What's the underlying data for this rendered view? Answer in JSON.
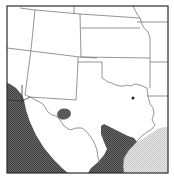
{
  "map": {
    "region": "South-central United States",
    "colors": {
      "background": "#ffffff",
      "border": "#2a2a2a",
      "state_line": "#777777",
      "dark_hatch": "#5a5a5a",
      "light_hatch": "#d8d8d8",
      "marker": "#222222"
    },
    "features": {
      "frame": "map-frame",
      "state_borders": [
        "texas",
        "new-mexico",
        "oklahoma",
        "colorado",
        "kansas",
        "arizona",
        "utah",
        "nebraska",
        "missouri",
        "arkansas",
        "louisiana"
      ],
      "dark_region_west": "shaded-region-mexico-west",
      "dark_region_south": "shaded-region-south-texas",
      "light_region_gulf": "shaded-region-gulf",
      "ellipse_region": "shaded-ellipse-west-texas",
      "point_marker": "point-marker-north-texas"
    }
  }
}
